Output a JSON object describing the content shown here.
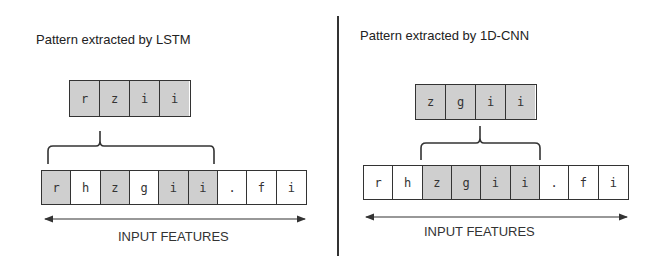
{
  "panels": [
    {
      "title": "Pattern extracted by LSTM",
      "pattern": [
        "r",
        "z",
        "i",
        "i"
      ],
      "input": [
        {
          "ch": "r",
          "hl": true
        },
        {
          "ch": "h",
          "hl": false
        },
        {
          "ch": "z",
          "hl": true
        },
        {
          "ch": "g",
          "hl": false
        },
        {
          "ch": "i",
          "hl": true
        },
        {
          "ch": "i",
          "hl": true
        },
        {
          "ch": ".",
          "hl": false
        },
        {
          "ch": "f",
          "hl": false
        },
        {
          "ch": "i",
          "hl": false
        }
      ],
      "axis_label": "INPUT FEATURES"
    },
    {
      "title": "Pattern extracted by 1D-CNN",
      "pattern": [
        "z",
        "g",
        "i",
        "i"
      ],
      "input": [
        {
          "ch": "r",
          "hl": false
        },
        {
          "ch": "h",
          "hl": false
        },
        {
          "ch": "z",
          "hl": true
        },
        {
          "ch": "g",
          "hl": true
        },
        {
          "ch": "i",
          "hl": true
        },
        {
          "ch": "i",
          "hl": true
        },
        {
          "ch": ".",
          "hl": false
        },
        {
          "ch": "f",
          "hl": false
        },
        {
          "ch": "i",
          "hl": false
        }
      ],
      "axis_label": "INPUT FEATURES"
    }
  ],
  "colors": {
    "highlight": "#cfcfcf",
    "line": "#333333"
  }
}
